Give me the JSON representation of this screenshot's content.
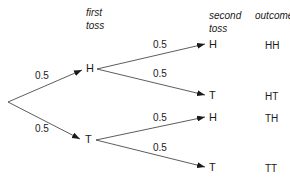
{
  "headers": {
    "first_toss": [
      "first",
      "toss"
    ],
    "second_toss": [
      "second",
      "toss"
    ],
    "outcome": "outcome"
  },
  "tree": {
    "root": {
      "x": 8,
      "y": 102
    },
    "first_level": [
      {
        "label": "H",
        "prob": "0.5"
      },
      {
        "label": "T",
        "prob": "0.5"
      }
    ],
    "second_level": [
      {
        "parent": "H",
        "label": "H",
        "prob": "0.5",
        "outcome": "HH"
      },
      {
        "parent": "H",
        "label": "T",
        "prob": "0.5",
        "outcome": "HT"
      },
      {
        "parent": "T",
        "label": "H",
        "prob": "0.5",
        "outcome": "TH"
      },
      {
        "parent": "T",
        "label": "T",
        "prob": "0.5",
        "outcome": "TT"
      }
    ]
  },
  "colors": {
    "line": "#333333",
    "text": "#1a1a1a"
  }
}
